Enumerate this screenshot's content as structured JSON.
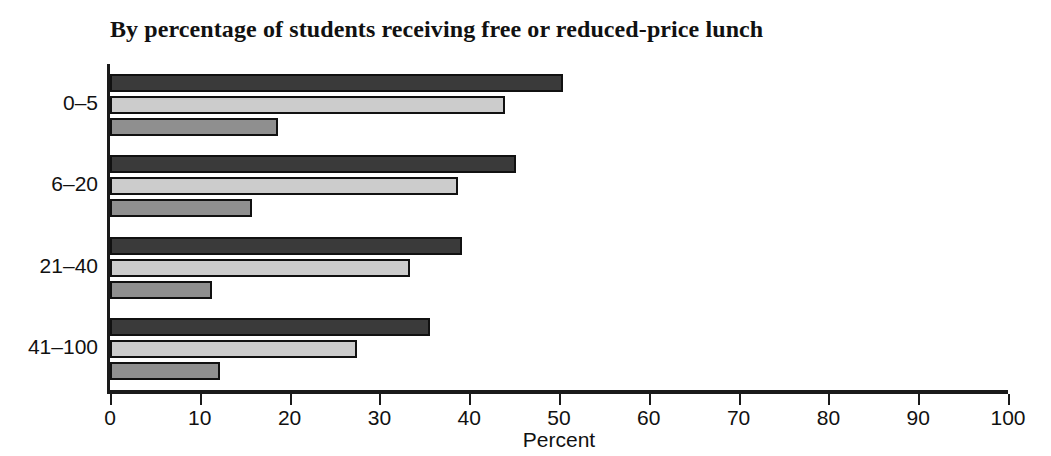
{
  "chart_data": {
    "type": "bar",
    "orientation": "horizontal",
    "title": "By percentage of students receiving free or reduced-price lunch",
    "xlabel": "Percent",
    "ylabel": "",
    "xlim": [
      0,
      100
    ],
    "xticks": [
      0,
      10,
      20,
      30,
      40,
      50,
      60,
      70,
      80,
      90,
      100
    ],
    "xtick_labels": [
      "0",
      "10",
      "20",
      "30",
      "40",
      "50",
      "60",
      "70",
      "80",
      "90",
      "100"
    ],
    "grid": false,
    "legend": "none",
    "categories": [
      "0–5",
      "6–20",
      "21–40",
      "41–100"
    ],
    "series": [
      {
        "name": "series-1",
        "color": "#3a3a3a",
        "values": [
          50.5,
          45.2,
          39.2,
          35.6
        ]
      },
      {
        "name": "series-2",
        "color": "#cccccc",
        "values": [
          44.0,
          38.8,
          33.4,
          27.5
        ]
      },
      {
        "name": "series-3",
        "color": "#8f8f8f",
        "values": [
          18.7,
          15.8,
          11.4,
          12.2
        ]
      }
    ]
  }
}
